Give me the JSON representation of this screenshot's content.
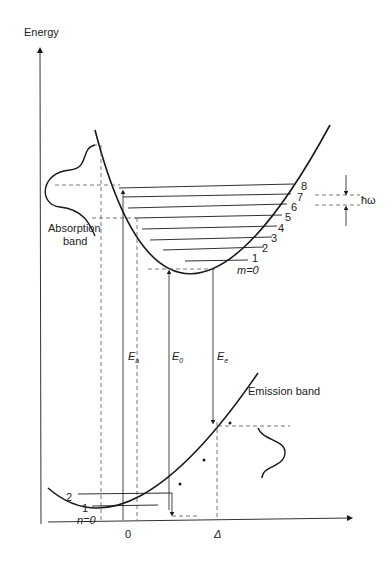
{
  "axes": {
    "y_label": "Energy",
    "x_ticks": [
      {
        "label": "0",
        "x": 128
      },
      {
        "label": "Δ",
        "x": 218
      }
    ]
  },
  "upper_curve": {
    "levels": [
      "m=0",
      "1",
      "2",
      "3",
      "4",
      "5",
      "6",
      "7",
      "8"
    ],
    "quantum_label": "ħω"
  },
  "lower_curve": {
    "levels": [
      "n=0",
      "1",
      "2"
    ]
  },
  "transitions": {
    "absorption": "E",
    "absorption_sub": "a",
    "zero_phonon": "E",
    "zero_phonon_sub": "0",
    "emission": "E",
    "emission_sub": "e"
  },
  "bands": {
    "absorption": [
      "Absorption",
      "band"
    ],
    "emission": "Emission band"
  },
  "colors": {
    "line": "#1a1a1a",
    "dashed": "#555555"
  }
}
